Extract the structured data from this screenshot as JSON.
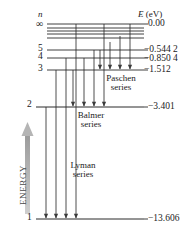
{
  "figure": {
    "type": "energy-level-diagram",
    "axis_headers": {
      "left": "n",
      "right_prefix": "E",
      "right_unit": "(eV)"
    },
    "energy_axis_label": "ENERGY",
    "levels": [
      {
        "n": "∞",
        "energy": "0.00",
        "y": 24,
        "label_y": 19,
        "value_y": 19,
        "show_line": true,
        "line_x1": 47,
        "line_x2": 144
      },
      {
        "n": "",
        "energy": "",
        "y": 28,
        "label_y": 0,
        "value_y": 0,
        "show_line": true,
        "line_x1": 47,
        "line_x2": 144
      },
      {
        "n": "",
        "energy": "",
        "y": 31,
        "label_y": 0,
        "value_y": 0,
        "show_line": true,
        "line_x1": 47,
        "line_x2": 144
      },
      {
        "n": "",
        "energy": "",
        "y": 34,
        "label_y": 0,
        "value_y": 0,
        "show_line": true,
        "line_x1": 47,
        "line_x2": 144
      },
      {
        "n": "",
        "energy": "",
        "y": 38,
        "label_y": 0,
        "value_y": 0,
        "show_line": true,
        "line_x1": 47,
        "line_x2": 144
      },
      {
        "n": "5",
        "energy": "−0.544 2",
        "y": 50,
        "label_y": 44,
        "value_y": 45,
        "show_line": true,
        "line_x1": 47,
        "line_x2": 144
      },
      {
        "n": "4",
        "energy": "−0.850 4",
        "y": 58,
        "label_y": 52,
        "value_y": 54,
        "show_line": true,
        "line_x1": 47,
        "line_x2": 144
      },
      {
        "n": "3",
        "energy": "−1.512",
        "y": 70,
        "label_y": 64,
        "value_y": 65,
        "show_line": true,
        "line_x1": 47,
        "line_x2": 144
      },
      {
        "n": "2",
        "energy": "−3.401",
        "y": 107,
        "label_y": 100,
        "value_y": 102,
        "show_line": true,
        "line_x1": 36,
        "line_x2": 144
      },
      {
        "n": "1",
        "energy": "−13.606",
        "y": 219,
        "label_y": 213,
        "value_y": 214,
        "show_line": true,
        "line_x1": 36,
        "line_x2": 144
      }
    ],
    "series": [
      {
        "name": "Paschen",
        "line1": "Paschen",
        "line2": "series",
        "label_x": 118,
        "label_y": 74,
        "to_level_y": 70,
        "arrows_x": [
          100,
          110,
          120,
          130
        ],
        "from_y": [
          50,
          42,
          36,
          24
        ]
      },
      {
        "name": "Balmer",
        "line1": "Balmer",
        "line2": "series",
        "label_x": 90,
        "label_y": 111,
        "to_level_y": 107,
        "arrows_x": [
          73,
          84,
          94,
          104
        ],
        "from_y": [
          70,
          58,
          50,
          24
        ]
      },
      {
        "name": "Lyman",
        "line1": "Lyman",
        "line2": "series",
        "label_x": 80,
        "label_y": 161,
        "to_level_y": 219,
        "arrows_x": [
          46,
          56,
          66,
          76
        ],
        "from_y": [
          107,
          70,
          58,
          24
        ]
      }
    ],
    "colors": {
      "line": "#2b2b2b",
      "arrow": "#3a3a3a",
      "energy_arrow": "#a8a8a8",
      "energy_text": "#4a4a4a",
      "background": "#ffffff"
    }
  }
}
